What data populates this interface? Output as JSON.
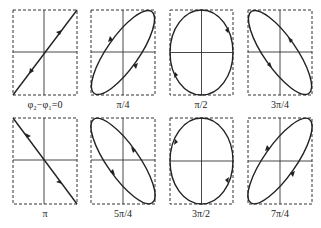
{
  "panels": [
    {
      "label": "φ₂−φ₁=0",
      "phase": "0",
      "shape": "line-positive"
    },
    {
      "label": "π/4",
      "phase": "π/4",
      "shape": "ellipse-positive"
    },
    {
      "label": "π/2",
      "phase": "π/2",
      "shape": "ellipse-upright"
    },
    {
      "label": "3π/4",
      "phase": "3π/4",
      "shape": "ellipse-negative"
    },
    {
      "label": "π",
      "phase": "π",
      "shape": "line-negative"
    },
    {
      "label": "5π/4",
      "phase": "5π/4",
      "shape": "ellipse-negative"
    },
    {
      "label": "3π/2",
      "phase": "3π/2",
      "shape": "ellipse-upright"
    },
    {
      "label": "7π/4",
      "phase": "7π/4",
      "shape": "ellipse-positive"
    }
  ],
  "colors": {
    "stroke": "#222222",
    "background": "#ffffff"
  }
}
